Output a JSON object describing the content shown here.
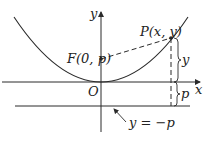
{
  "diagram": {
    "labels": {
      "y_axis": "y",
      "x_axis": "x",
      "origin": "O",
      "focus": "F(0, p)",
      "point": "P(x, y)",
      "vertical_distance": "y",
      "offset": "p",
      "directrix": "y = −p"
    },
    "colors": {
      "stroke": "#2a2a2a",
      "background": "#ffffff"
    }
  }
}
